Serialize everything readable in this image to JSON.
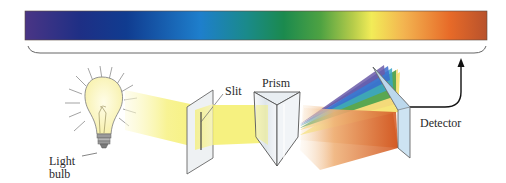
{
  "diagram": {
    "spectrum_bar": {
      "gradient_stops": [
        {
          "offset": "0%",
          "color": "#4a3585"
        },
        {
          "offset": "12%",
          "color": "#1e2f85"
        },
        {
          "offset": "22%",
          "color": "#103c90"
        },
        {
          "offset": "38%",
          "color": "#1e7fcc"
        },
        {
          "offset": "48%",
          "color": "#1a8a8a"
        },
        {
          "offset": "56%",
          "color": "#1b8a4e"
        },
        {
          "offset": "64%",
          "color": "#4ea242"
        },
        {
          "offset": "71%",
          "color": "#b6cc4a"
        },
        {
          "offset": "75%",
          "color": "#f2ec58"
        },
        {
          "offset": "82%",
          "color": "#f3b450"
        },
        {
          "offset": "92%",
          "color": "#e76a28"
        },
        {
          "offset": "100%",
          "color": "#b8522c"
        }
      ]
    },
    "labels": {
      "light_bulb_line1": "Light",
      "light_bulb_line2": "bulb",
      "slit": "Slit",
      "prism": "Prism",
      "detector": "Detector"
    },
    "colors": {
      "outline": "#555555",
      "beam_yellow": "#f5ef6a",
      "bulb_glow": "#fbf7c4",
      "panel_fill": "#eef1f3",
      "detector_fill": "#cde3f2",
      "arrow": "#111111"
    },
    "dispersed_bands": [
      {
        "name": "violet",
        "color": "#6a5aa8"
      },
      {
        "name": "blue",
        "color": "#3a6ccf"
      },
      {
        "name": "cyan",
        "color": "#3aa6c8"
      },
      {
        "name": "green",
        "color": "#3e9e4a"
      },
      {
        "name": "yellow",
        "color": "#f2e46a"
      },
      {
        "name": "orange-red",
        "color": "#d8642c"
      }
    ]
  }
}
